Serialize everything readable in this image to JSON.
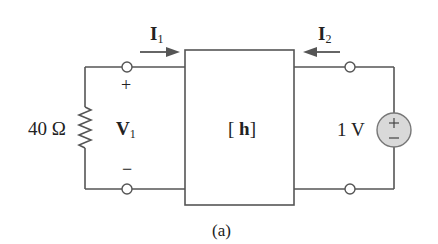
{
  "diagram": {
    "type": "two-port circuit",
    "caption": "(a)",
    "network": {
      "label_open": "[",
      "label_symbol": "h",
      "label_close": "]"
    },
    "port1": {
      "current_symbol": "I",
      "current_subscript": "1",
      "voltage_symbol": "V",
      "voltage_subscript": "1",
      "plus": "+",
      "minus": "−",
      "resistor_label": "40 Ω"
    },
    "port2": {
      "current_symbol": "I",
      "current_subscript": "2",
      "source_label": "1 V",
      "source_plus": "+",
      "source_minus": "−"
    },
    "colors": {
      "wire": "#555555",
      "source_fill": "#d9d9d9",
      "text": "#222222"
    }
  }
}
